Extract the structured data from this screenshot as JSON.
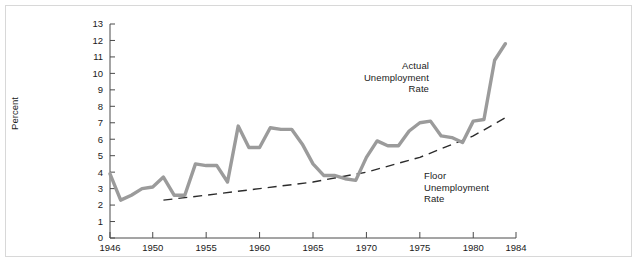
{
  "chart_data": {
    "type": "line",
    "title": "",
    "xlabel": "",
    "ylabel": "Percent",
    "xlim": [
      1946,
      1984
    ],
    "ylim": [
      0,
      13
    ],
    "xticks": [
      1946,
      1950,
      1955,
      1960,
      1965,
      1970,
      1975,
      1980,
      1984
    ],
    "xtick_labels": [
      "1946",
      "1950",
      "1955",
      "1960",
      "1965",
      "1970",
      "1975",
      "1980",
      "1984"
    ],
    "yticks": [
      0,
      1,
      2,
      3,
      4,
      5,
      6,
      7,
      8,
      9,
      10,
      11,
      12,
      13
    ],
    "ytick_labels": [
      "0",
      "1",
      "2",
      "3",
      "4",
      "5",
      "6",
      "7",
      "8",
      "9",
      "10",
      "11",
      "12",
      "13"
    ],
    "grid": false,
    "legend": "none",
    "annotations": [
      {
        "name": "actual-unemployment-rate",
        "lines": [
          "Actual",
          "Unemployment",
          "Rate"
        ],
        "text": "Actual\nUnemployment\nRate",
        "align": "right"
      },
      {
        "name": "floor-unemployment-rate",
        "lines": [
          "Floor",
          "Unemployment",
          "Rate"
        ],
        "text": "Floor\nUnemployment\nRate",
        "align": "left"
      }
    ],
    "series": [
      {
        "name": "Actual Unemployment Rate",
        "style": "solid",
        "color": "#9b9b9b",
        "x": [
          1946,
          1947,
          1948,
          1949,
          1950,
          1951,
          1952,
          1953,
          1954,
          1955,
          1956,
          1957,
          1958,
          1959,
          1960,
          1961,
          1962,
          1963,
          1964,
          1965,
          1966,
          1967,
          1968,
          1969,
          1970,
          1971,
          1972,
          1973,
          1974,
          1975,
          1976,
          1977,
          1978,
          1979,
          1980,
          1981,
          1982,
          1983
        ],
        "values": [
          3.9,
          2.3,
          2.6,
          3.0,
          3.1,
          3.7,
          2.6,
          2.6,
          4.5,
          4.4,
          4.4,
          3.4,
          6.8,
          5.5,
          5.5,
          6.7,
          6.6,
          6.6,
          5.7,
          4.5,
          3.8,
          3.8,
          3.6,
          3.5,
          4.9,
          5.9,
          5.6,
          5.6,
          6.5,
          7.0,
          7.1,
          6.2,
          6.1,
          5.8,
          7.1,
          7.2,
          10.8,
          11.8
        ]
      },
      {
        "name": "Floor Unemployment Rate",
        "style": "dashed",
        "color": "#2b2b2b",
        "x": [
          1951,
          1955,
          1960,
          1965,
          1970,
          1975,
          1980,
          1983
        ],
        "values": [
          2.3,
          2.6,
          3.0,
          3.4,
          4.0,
          4.9,
          6.2,
          7.3
        ]
      }
    ]
  },
  "axis": {
    "y_title": "Percent"
  }
}
